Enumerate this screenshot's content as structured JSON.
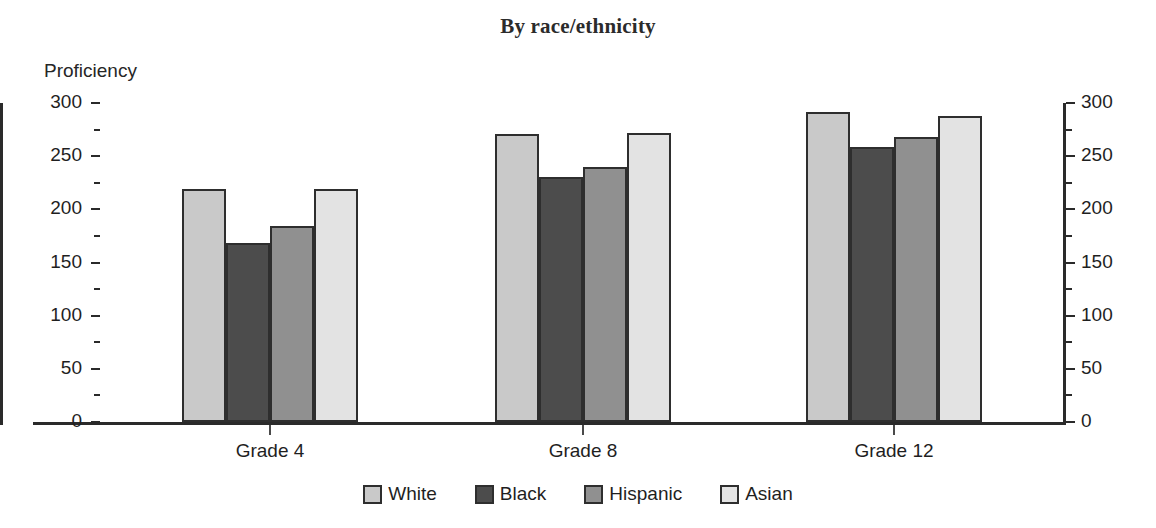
{
  "chart_data": {
    "type": "bar",
    "title": "By race/ethnicity",
    "ylabel": "Proficiency",
    "xlabel": "",
    "categories": [
      "Grade 4",
      "Grade 8",
      "Grade 12"
    ],
    "series": [
      {
        "name": "White",
        "values": [
          219,
          271,
          292
        ],
        "color": "#c9c9c9"
      },
      {
        "name": "Black",
        "values": [
          168,
          230,
          259
        ],
        "color": "#4c4c4c"
      },
      {
        "name": "Hispanic",
        "values": [
          184,
          240,
          268
        ],
        "color": "#909090"
      },
      {
        "name": "Asian",
        "values": [
          219,
          272,
          288
        ],
        "color": "#e3e3e3"
      }
    ],
    "ylim": [
      0,
      300
    ],
    "yticks": [
      0,
      50,
      100,
      150,
      200,
      250,
      300
    ],
    "ytick_labels_left": [
      "0",
      "50",
      "100",
      "150",
      "200",
      "250",
      "300"
    ],
    "ytick_labels_right": [
      "0",
      "50",
      "100",
      "150",
      "200",
      "250",
      "300"
    ],
    "minor_ticks": [
      25,
      75,
      125,
      175,
      225,
      275
    ],
    "grid": false,
    "legend_position": "bottom",
    "dual_y_axis": true
  },
  "legend": {
    "items": [
      {
        "label": "White",
        "color": "#c9c9c9"
      },
      {
        "label": "Black",
        "color": "#4c4c4c"
      },
      {
        "label": "Hispanic",
        "color": "#909090"
      },
      {
        "label": "Asian",
        "color": "#e3e3e3"
      }
    ]
  }
}
